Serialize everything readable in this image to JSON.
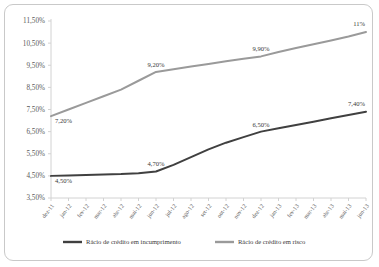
{
  "chart_data": {
    "type": "line",
    "title": "",
    "subtitle": "",
    "xlabel": "",
    "ylabel": "",
    "ylim": [
      3.5,
      11.5
    ],
    "ytick_step": 1.0,
    "grid": false,
    "legend_position": "bottom",
    "categories": [
      "dez-11",
      "jan-12",
      "fev-12",
      "mar-12",
      "abr-12",
      "mai-12",
      "jun-12",
      "jul-12",
      "ago-12",
      "set-12",
      "out-12",
      "nov-12",
      "dez-12",
      "jan-13",
      "fev-13",
      "mar-13",
      "abr-13",
      "mai-13",
      "jun-13"
    ],
    "ytick_labels": [
      "3,50%",
      "4,50%",
      "5,50%",
      "6,50%",
      "7,50%",
      "8,50%",
      "9,50%",
      "10,50%",
      "11,50%"
    ],
    "ytick_values": [
      3.5,
      4.5,
      5.5,
      6.5,
      7.5,
      8.5,
      9.5,
      10.5,
      11.5
    ],
    "series": [
      {
        "name": "Rácio de crédito em incumprimento",
        "color": "#404040",
        "values": [
          4.5,
          4.52,
          4.54,
          4.56,
          4.58,
          4.62,
          4.7,
          5.0,
          5.35,
          5.7,
          6.0,
          6.25,
          6.5,
          6.65,
          6.8,
          6.95,
          7.1,
          7.25,
          7.4
        ],
        "point_labels": [
          {
            "index": 0,
            "text": "4,50%"
          },
          {
            "index": 6,
            "text": "4,70%"
          },
          {
            "index": 12,
            "text": "6,50%"
          },
          {
            "index": 18,
            "text": "7,40%"
          }
        ]
      },
      {
        "name": "Rácio de crédito em risco",
        "color": "#9a9a9a",
        "values": [
          7.2,
          7.5,
          7.8,
          8.1,
          8.4,
          8.8,
          9.2,
          9.32,
          9.44,
          9.56,
          9.68,
          9.79,
          9.9,
          10.1,
          10.28,
          10.45,
          10.62,
          10.8,
          11.0
        ],
        "point_labels": [
          {
            "index": 0,
            "text": "7,20%"
          },
          {
            "index": 6,
            "text": "9,20%"
          },
          {
            "index": 12,
            "text": "9,90%"
          },
          {
            "index": 18,
            "text": "11%"
          }
        ]
      }
    ]
  },
  "legend": {
    "items": [
      {
        "label": "Rácio de crédito em incumprimento",
        "color": "#404040"
      },
      {
        "label": "Rácio de crédito em risco",
        "color": "#9a9a9a"
      }
    ]
  }
}
